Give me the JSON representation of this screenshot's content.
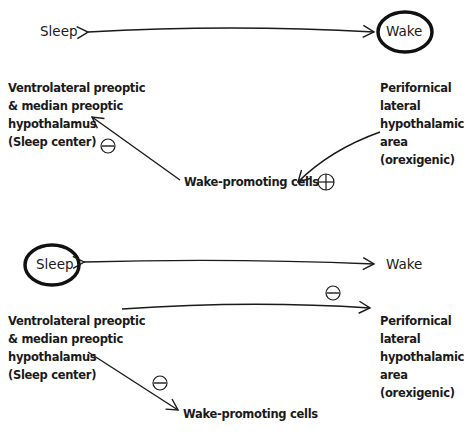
{
  "panel_top": {
    "sleep_label": "Sleep",
    "wake_label": "Wake",
    "highlighted_state": "Wake",
    "left_region": {
      "lines": [
        "Ventrolateral preoptic",
        "& median preoptic",
        "hypothalamus",
        "(Sleep center)"
      ]
    },
    "right_region": {
      "lines": [
        "Perifornical",
        "lateral",
        "hypothalamic",
        "area (orexigenic)"
      ]
    },
    "target_label": "Wake-promoting cells",
    "signs": {
      "to_left_region": "minus",
      "from_right_region": "plus"
    }
  },
  "panel_bottom": {
    "sleep_label": "Sleep",
    "wake_label": "Wake",
    "highlighted_state": "Sleep",
    "left_region": {
      "lines": [
        "Ventrolateral preoptic",
        "& median preoptic",
        "hypothalamus",
        "(Sleep center)"
      ]
    },
    "right_region": {
      "lines": [
        "Perifornical",
        "lateral",
        "hypothalamic",
        "area (orexigenic)"
      ]
    },
    "target_label": "Wake-promoting cells",
    "signs": {
      "to_right_region": "minus",
      "to_wake_cells": "minus"
    }
  }
}
